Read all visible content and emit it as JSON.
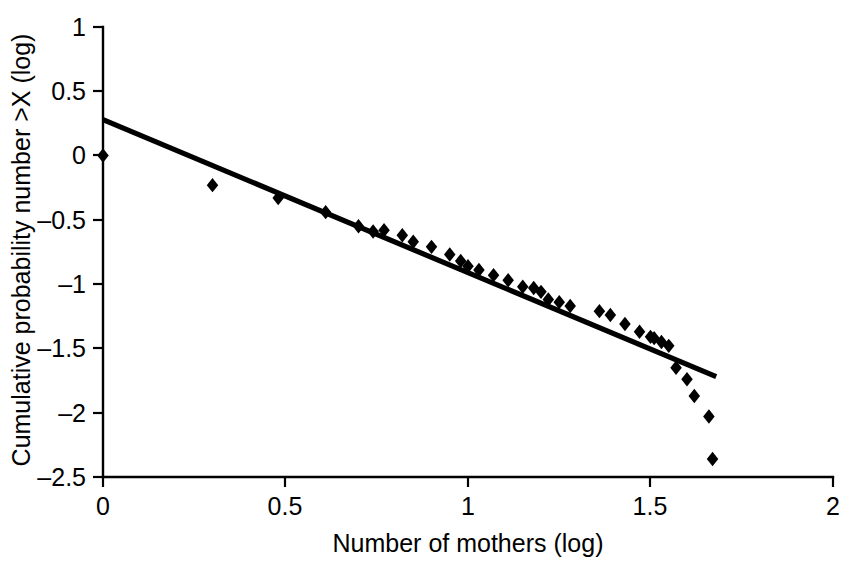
{
  "chart_data": {
    "type": "scatter",
    "title": "",
    "xlabel": "Number of mothers (log)",
    "ylabel": "Cumulative probability number >X (log)",
    "xlim": [
      0,
      2
    ],
    "ylim": [
      -2.5,
      1
    ],
    "xticks": [
      0,
      0.5,
      1,
      1.5,
      2
    ],
    "xtick_labels": [
      "0",
      "0.5",
      "1",
      "1.5",
      "2"
    ],
    "yticks": [
      1,
      0.5,
      0,
      -0.5,
      -1,
      -1.5,
      -2,
      -2.5
    ],
    "ytick_labels": [
      "1",
      "0.5",
      "0",
      "–0.5",
      "–1",
      "–1.5",
      "–2",
      "–2.5"
    ],
    "grid": false,
    "legend": null,
    "marker": "diamond",
    "marker_color": "#000000",
    "line_color": "#000000",
    "points": [
      [
        0.0,
        0.0
      ],
      [
        0.3,
        -0.23
      ],
      [
        0.48,
        -0.33
      ],
      [
        0.61,
        -0.44
      ],
      [
        0.7,
        -0.55
      ],
      [
        0.74,
        -0.59
      ],
      [
        0.77,
        -0.58
      ],
      [
        0.82,
        -0.62
      ],
      [
        0.85,
        -0.67
      ],
      [
        0.9,
        -0.71
      ],
      [
        0.95,
        -0.77
      ],
      [
        0.98,
        -0.82
      ],
      [
        1.0,
        -0.86
      ],
      [
        1.03,
        -0.89
      ],
      [
        1.07,
        -0.93
      ],
      [
        1.11,
        -0.97
      ],
      [
        1.15,
        -1.02
      ],
      [
        1.18,
        -1.03
      ],
      [
        1.2,
        -1.06
      ],
      [
        1.22,
        -1.12
      ],
      [
        1.25,
        -1.14
      ],
      [
        1.28,
        -1.17
      ],
      [
        1.36,
        -1.21
      ],
      [
        1.39,
        -1.24
      ],
      [
        1.43,
        -1.31
      ],
      [
        1.47,
        -1.37
      ],
      [
        1.5,
        -1.41
      ],
      [
        1.51,
        -1.42
      ],
      [
        1.53,
        -1.45
      ],
      [
        1.55,
        -1.48
      ],
      [
        1.57,
        -1.65
      ],
      [
        1.6,
        -1.74
      ],
      [
        1.62,
        -1.87
      ],
      [
        1.66,
        -2.03
      ],
      [
        1.67,
        -2.36
      ]
    ],
    "fit_line": {
      "x_start": 0.0,
      "y_start": 0.28,
      "x_end": 1.68,
      "y_end": -1.72,
      "slope": -1.19,
      "intercept": 0.28
    }
  }
}
